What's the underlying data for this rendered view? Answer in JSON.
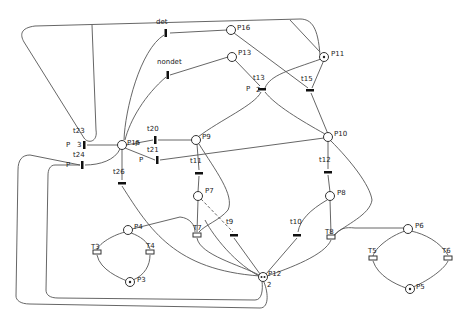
{
  "diagram": {
    "type": "petri-net",
    "places": [
      {
        "id": "P16",
        "label": "P16",
        "x": 231,
        "y": 30,
        "tokens": 0
      },
      {
        "id": "P13",
        "label": "P13",
        "x": 232,
        "y": 57,
        "tokens": 0
      },
      {
        "id": "P11",
        "label": "P11",
        "x": 324,
        "y": 57,
        "tokens": 1
      },
      {
        "id": "P15",
        "label": "P15",
        "x": 122,
        "y": 145,
        "tokens": 0
      },
      {
        "id": "P9",
        "label": "P9",
        "x": 196,
        "y": 140,
        "tokens": 0
      },
      {
        "id": "P10",
        "label": "P10",
        "x": 328,
        "y": 137,
        "tokens": 0
      },
      {
        "id": "P7",
        "label": "P7",
        "x": 198,
        "y": 196,
        "tokens": 0
      },
      {
        "id": "P8",
        "label": "P8",
        "x": 330,
        "y": 196,
        "tokens": 0
      },
      {
        "id": "P4",
        "label": "P4",
        "x": 128,
        "y": 230,
        "tokens": 0
      },
      {
        "id": "P3",
        "label": "P3",
        "x": 130,
        "y": 282,
        "tokens": 1
      },
      {
        "id": "P12",
        "label": "P12",
        "x": 263,
        "y": 277,
        "tokens": 2
      },
      {
        "id": "P6",
        "label": "P6",
        "x": 408,
        "y": 229,
        "tokens": 0
      },
      {
        "id": "P5",
        "label": "P5",
        "x": 410,
        "y": 289,
        "tokens": 1
      }
    ],
    "transitions": [
      {
        "id": "det",
        "label": "det",
        "x": 166,
        "y": 33
      },
      {
        "id": "nondet",
        "label": "nondet",
        "x": 168,
        "y": 75
      },
      {
        "id": "t13",
        "label": "t13",
        "x": 262,
        "y": 89
      },
      {
        "id": "t15",
        "label": "t15",
        "x": 310,
        "y": 90
      },
      {
        "id": "t23",
        "label": "t23",
        "x": 84,
        "y": 145
      },
      {
        "id": "t24",
        "label": "t24",
        "x": 82,
        "y": 165
      },
      {
        "id": "t20",
        "label": "t20",
        "x": 155,
        "y": 140
      },
      {
        "id": "t21",
        "label": "t21",
        "x": 157,
        "y": 160
      },
      {
        "id": "t26",
        "label": "t26",
        "x": 122,
        "y": 183
      },
      {
        "id": "t11",
        "label": "t11",
        "x": 199,
        "y": 173
      },
      {
        "id": "t12",
        "label": "t12",
        "x": 328,
        "y": 172
      },
      {
        "id": "T7",
        "label": "T7",
        "x": 197,
        "y": 235
      },
      {
        "id": "t9",
        "label": "t9",
        "x": 234,
        "y": 235
      },
      {
        "id": "t10",
        "label": "t10",
        "x": 297,
        "y": 235
      },
      {
        "id": "T8",
        "label": "T8",
        "x": 331,
        "y": 237
      },
      {
        "id": "T3",
        "label": "T3",
        "x": 97,
        "y": 252
      },
      {
        "id": "T4",
        "label": "T4",
        "x": 150,
        "y": 252
      },
      {
        "id": "T5",
        "label": "T5",
        "x": 373,
        "y": 258
      },
      {
        "id": "T6",
        "label": "T6",
        "x": 448,
        "y": 258
      }
    ],
    "annotations": [
      {
        "text": "P",
        "x": 246,
        "y": 91
      },
      {
        "text": "2",
        "x": 258,
        "y": 91
      },
      {
        "text": "P",
        "x": 66,
        "y": 146
      },
      {
        "text": "3",
        "x": 78,
        "y": 146
      },
      {
        "text": "P",
        "x": 66,
        "y": 166
      },
      {
        "text": "P",
        "x": 140,
        "y": 161
      },
      {
        "text": "P",
        "x": 136,
        "y": 145
      },
      {
        "text": "2",
        "x": 268,
        "y": 286
      }
    ]
  }
}
